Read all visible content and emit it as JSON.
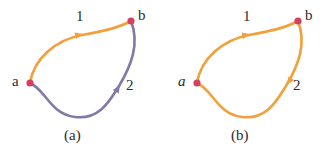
{
  "figure": {
    "background_color": "#ffffff",
    "colors": {
      "orange": "#F2A03C",
      "purple": "#8378A6",
      "vertex_red": "#D6405F",
      "text": "#2b2b2b"
    },
    "panels": [
      {
        "id": "a",
        "caption": "(a)",
        "vertices": [
          {
            "name": "a",
            "label": "a",
            "italic": false,
            "color": "#D6405F",
            "x": 30,
            "y": 83
          },
          {
            "name": "b",
            "label": "b",
            "italic": false,
            "color": "#D6405F",
            "x": 131,
            "y": 21
          }
        ],
        "edges": [
          {
            "name": "path-1",
            "label": "1",
            "color": "#F2A03C",
            "from": "a",
            "to": "b",
            "arrow_direction": "right",
            "path": "M 30 83 C 34 58, 56 40, 82 35 C 104 31, 118 28, 131 21",
            "arrow_at": {
              "x": 83,
              "y": 34,
              "angle": -13
            }
          },
          {
            "name": "path-2",
            "label": "2",
            "color": "#8378A6",
            "from": "a",
            "to": "b",
            "arrow_direction": "up",
            "path": "M 30 83 C 46 90, 50 114, 75 117 C 100 120, 110 100, 119 86 C 131 66, 140 44, 131 21",
            "arrow_at": {
              "x": 120,
              "y": 85,
              "angle": -58
            }
          }
        ]
      },
      {
        "id": "b",
        "caption": "(b)",
        "vertices": [
          {
            "name": "a",
            "label": "a",
            "italic": true,
            "color": "#D6405F",
            "x": 30,
            "y": 83
          },
          {
            "name": "b",
            "label": "b",
            "italic": false,
            "color": "#D6405F",
            "x": 131,
            "y": 21
          }
        ],
        "edges": [
          {
            "name": "path-1",
            "label": "1",
            "color": "#F2A03C",
            "from": "a",
            "to": "b",
            "arrow_direction": "right",
            "path": "M 30 83 C 34 58, 56 40, 82 35 C 104 31, 118 28, 131 21",
            "arrow_at": {
              "x": 83,
              "y": 34,
              "angle": -13
            }
          },
          {
            "name": "path-2",
            "label": "2",
            "color": "#F2A03C",
            "from": "b",
            "to": "a",
            "arrow_direction": "down",
            "path": "M 131 21 C 140 44, 131 66, 119 86 C 110 100, 100 120, 75 117 C 50 114, 46 90, 30 83",
            "arrow_at": {
              "x": 120,
              "y": 85,
              "angle": 122
            }
          }
        ]
      }
    ]
  }
}
